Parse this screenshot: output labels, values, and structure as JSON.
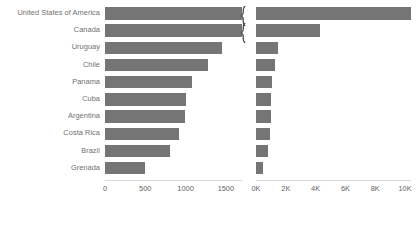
{
  "chart_data": {
    "type": "bar",
    "title": "",
    "subtitle": "",
    "xlabel": "",
    "ylabel": "",
    "grid": false,
    "legend": "none",
    "orientation": "horizontal",
    "layout": "two-panel broken axis, categories shared, left panel zoomed scale and right panel full scale",
    "categories": [
      "United States of America",
      "Canada",
      "Uruguay",
      "Chile",
      "Panama",
      "Cuba",
      "Argentina",
      "Costa Rica",
      "Brazil",
      "Grenada"
    ],
    "panels": [
      {
        "name": "left-panel",
        "xlim": [
          0,
          1700
        ],
        "ticks": [
          {
            "value": 0,
            "label": "0"
          },
          {
            "value": 500,
            "label": "500"
          },
          {
            "value": 1000,
            "label": "1000"
          },
          {
            "value": 1500,
            "label": "1500"
          }
        ],
        "axis_break": true,
        "values": [
          1700,
          1700,
          1450,
          1280,
          1080,
          1010,
          990,
          920,
          810,
          500
        ]
      },
      {
        "name": "right-panel",
        "xlim": [
          0,
          10400
        ],
        "ticks": [
          {
            "value": 0,
            "label": "0K"
          },
          {
            "value": 2000,
            "label": "2K"
          },
          {
            "value": 4000,
            "label": "4K"
          },
          {
            "value": 6000,
            "label": "6K"
          },
          {
            "value": 8000,
            "label": "8K"
          },
          {
            "value": 10000,
            "label": "10K"
          }
        ],
        "axis_break": false,
        "values": [
          10400,
          4300,
          1450,
          1280,
          1080,
          1010,
          990,
          920,
          810,
          500
        ]
      }
    ],
    "annotation": "Both bar charts start at zero",
    "series_color": "#757575",
    "label_color": "#6f6f6f",
    "tick_color": "#5f5f5f",
    "annotation_color": "#5b5b5b",
    "background": "#ffffff"
  },
  "annotation": {
    "text": "Both bar charts start at zero",
    "left_arrow_icon": "curved-arrow-up-icon",
    "right_arrow_icon": "curved-arrow-up-icon"
  },
  "break_marks": {
    "icon": "axis-break-squiggle-icon",
    "count": 2
  }
}
